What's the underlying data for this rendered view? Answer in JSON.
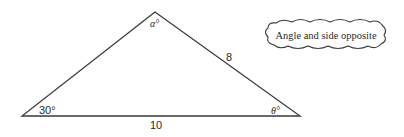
{
  "diagram": {
    "type": "triangle",
    "vertices": {
      "apex": [
        155,
        12
      ],
      "left": [
        22,
        116
      ],
      "right": [
        300,
        116
      ]
    },
    "angles": {
      "apex_label": "α°",
      "left_label": "30°",
      "right_label": "θ°"
    },
    "sides": {
      "base_label": "10",
      "right_side_label": "8"
    },
    "callout": {
      "text": "Angle and side opposite",
      "shape": "cloud"
    },
    "colors": {
      "stroke": "#3a3a3a",
      "text": "#2a2a2a",
      "background": "#ffffff"
    }
  }
}
